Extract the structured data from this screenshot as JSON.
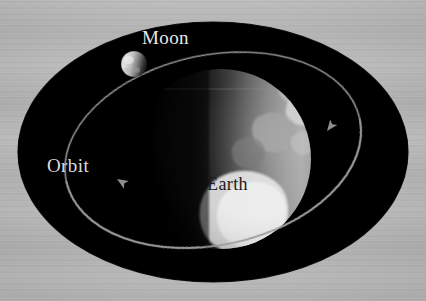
{
  "figure": {
    "kind": "astronomy-diagram",
    "background_color": "#b5b5b5",
    "field_color": "#000000"
  },
  "labels": {
    "moon": "Moon",
    "orbit": "Orbit",
    "earth": "Earth"
  },
  "bodies": {
    "earth": {
      "name": "Earth",
      "center_x": 221,
      "center_y": 159,
      "radius": 90,
      "lit_side": "right",
      "terminator": "vertical-left-of-center",
      "highlight_color": "#d8d8d8",
      "shadow_color": "#050505"
    },
    "moon": {
      "name": "Moon",
      "center_x": 134,
      "center_y": 64,
      "radius": 13,
      "lit_side": "left",
      "highlight_color": "#e4e4e4",
      "shadow_color": "#2a2a2a"
    }
  },
  "orbit": {
    "name": "Orbit",
    "stroke_color": "#8c8c8c",
    "stroke_width": 1.6,
    "arrow_direction": "counterclockwise",
    "arrowheads": [
      {
        "id": "arrow-left",
        "x": 117,
        "y": 179,
        "angle": 215
      },
      {
        "id": "arrow-right",
        "x": 325,
        "y": 128,
        "angle": 52
      }
    ]
  },
  "space_field": {
    "center_x": 213,
    "center_y": 152,
    "radius_x": 195,
    "radius_y": 130
  }
}
